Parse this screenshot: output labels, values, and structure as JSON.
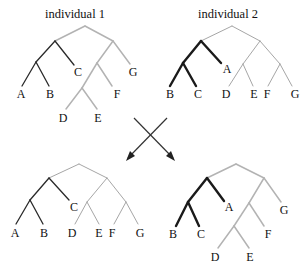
{
  "figure": {
    "colors": {
      "dark_branch": "#2a2a2a",
      "thick_branch": "#1a1a1a",
      "light_branch": "#b3b3b3",
      "thin_branch": "#a6a6a6",
      "text": "#111111"
    },
    "parents": [
      {
        "title": "individual 1",
        "leaves": [
          "A",
          "B",
          "C",
          "D",
          "E",
          "F",
          "G"
        ],
        "newick": "(((A,B),C),(((D,E),F),G))"
      },
      {
        "title": "individual 2",
        "leaves": [
          "B",
          "C",
          "A",
          "D",
          "E",
          "F",
          "G"
        ],
        "newick": "(((B,C),A),((D,E),(F,G)))"
      }
    ],
    "offspring": [
      {
        "leaves": [
          "A",
          "B",
          "C",
          "D",
          "E",
          "F",
          "G"
        ],
        "newick": "(((A,B),C),((D,E),(F,G)))"
      },
      {
        "leaves": [
          "B",
          "C",
          "A",
          "G",
          "F",
          "D",
          "E"
        ],
        "newick": "(((B,C),A),(((D,E),F),G))"
      }
    ],
    "crossover_symbol": "X arrows"
  }
}
